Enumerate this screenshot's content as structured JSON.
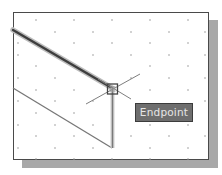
{
  "viewport": {
    "background": "#ffffff",
    "border_color": "#4a4a4a",
    "shadow_color": "#a8a8a8",
    "grid": "dotted"
  },
  "snap": {
    "marker_type": "endpoint-square",
    "crosshair": true
  },
  "tooltip": {
    "label": "Endpoint",
    "background": "#6e6e6e",
    "text_color": "#e6e6e6"
  }
}
